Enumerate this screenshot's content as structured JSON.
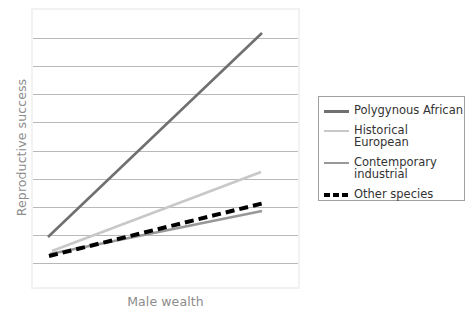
{
  "chart_data": {
    "type": "line",
    "title": "",
    "xlabel": "Male wealth",
    "ylabel": "Reproductive success",
    "grid": true,
    "gridlines": 9,
    "axis_ticks_labeled": false,
    "xlim": [
      0,
      1
    ],
    "ylim": [
      0,
      1
    ],
    "legend_position": "right",
    "series": [
      {
        "name": "Polygynous African",
        "color": "#707070",
        "style": "solid",
        "x": [
          0.065,
          1.0
        ],
        "y": [
          0.185,
          0.912
        ],
        "points_px": [
          [
            48,
            237
          ],
          [
            262,
            33
          ]
        ]
      },
      {
        "name": "Historical European",
        "color": "#c8c8c8",
        "style": "solid",
        "x": [
          0.078,
          0.995
        ],
        "y": [
          0.135,
          0.417
        ],
        "points_px": [
          [
            52,
            251
          ],
          [
            261,
            172
          ]
        ]
      },
      {
        "name": "Contemporary industrial",
        "color": "#989898",
        "style": "solid",
        "x": [
          0.07,
          1.0
        ],
        "y": [
          0.124,
          0.278
        ],
        "points_px": [
          [
            50,
            254
          ],
          [
            262,
            211
          ]
        ]
      },
      {
        "name": "Other species",
        "color": "#000000",
        "style": "dashed",
        "x": [
          0.067,
          1.01
        ],
        "y": [
          0.117,
          0.306
        ],
        "points_px": [
          [
            49,
            256
          ],
          [
            264,
            203
          ]
        ]
      }
    ]
  },
  "axes": {
    "y_title": "Reproductive success",
    "x_title": "Male wealth"
  },
  "legend": {
    "items": [
      {
        "label": "Polygynous African",
        "color": "#707070",
        "style": "solid"
      },
      {
        "label": "Historical European",
        "color": "#c8c8c8",
        "style": "solid"
      },
      {
        "label": "Contemporary\nindustrial",
        "color": "#989898",
        "style": "solid"
      },
      {
        "label": "Other species",
        "color": "#000000",
        "style": "dashed"
      }
    ]
  },
  "colors": {
    "grid": "#b9b9b9",
    "frame": "#f2f2f2",
    "axis_text": "#8c8c8c",
    "legend_text": "#333333",
    "legend_border": "#a0a0a0",
    "background": "#ffffff"
  }
}
